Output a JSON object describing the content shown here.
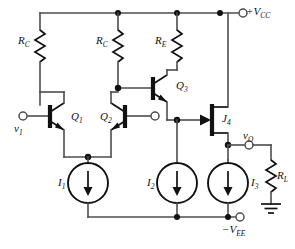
{
  "figure": {
    "type": "circuit-diagram",
    "background_color": "#ffffff",
    "wire_color": "#4d4d4d",
    "device_color": "#111111"
  },
  "rails": {
    "top": {
      "name": "positive-supply-rail",
      "terminal_label_main": "+V",
      "terminal_label_sub": "CC"
    },
    "bottom": {
      "name": "negative-supply-rail",
      "terminal_label_main": "−V",
      "terminal_label_sub": "EE"
    }
  },
  "ports": {
    "input": {
      "label_main": "v",
      "label_sub": "1",
      "name": "input-terminal"
    },
    "output": {
      "label_main": "v",
      "label_sub": "O",
      "name": "output-terminal"
    },
    "q2_base": {
      "name": "q2-base-terminal"
    }
  },
  "resistors": [
    {
      "id": "rc1",
      "label_main": "R",
      "label_sub": "C",
      "name": "resistor-rc1"
    },
    {
      "id": "rc2",
      "label_main": "R",
      "label_sub": "C",
      "name": "resistor-rc2"
    },
    {
      "id": "re",
      "label_main": "R",
      "label_sub": "E",
      "name": "resistor-re"
    },
    {
      "id": "rl",
      "label_main": "R",
      "label_sub": "L",
      "name": "resistor-rl"
    }
  ],
  "transistors": [
    {
      "id": "q1",
      "label_main": "Q",
      "label_sub": "1",
      "device": "npn-bjt",
      "name": "transistor-q1"
    },
    {
      "id": "q2",
      "label_main": "Q",
      "label_sub": "2",
      "device": "npn-bjt",
      "name": "transistor-q2"
    },
    {
      "id": "q3",
      "label_main": "Q",
      "label_sub": "3",
      "device": "npn-bjt",
      "name": "transistor-q3"
    },
    {
      "id": "j4",
      "label_main": "J",
      "label_sub": "4",
      "device": "n-channel-jfet",
      "name": "transistor-j4"
    }
  ],
  "current_sources": [
    {
      "id": "i1",
      "label_main": "I",
      "label_sub": "1",
      "direction": "down",
      "name": "current-source-i1"
    },
    {
      "id": "i2",
      "label_main": "I",
      "label_sub": "2",
      "direction": "down",
      "name": "current-source-i2"
    },
    {
      "id": "i3",
      "label_main": "I",
      "label_sub": "3",
      "direction": "down",
      "name": "current-source-i3"
    }
  ],
  "ground": {
    "name": "ground-symbol",
    "style": "earth"
  }
}
